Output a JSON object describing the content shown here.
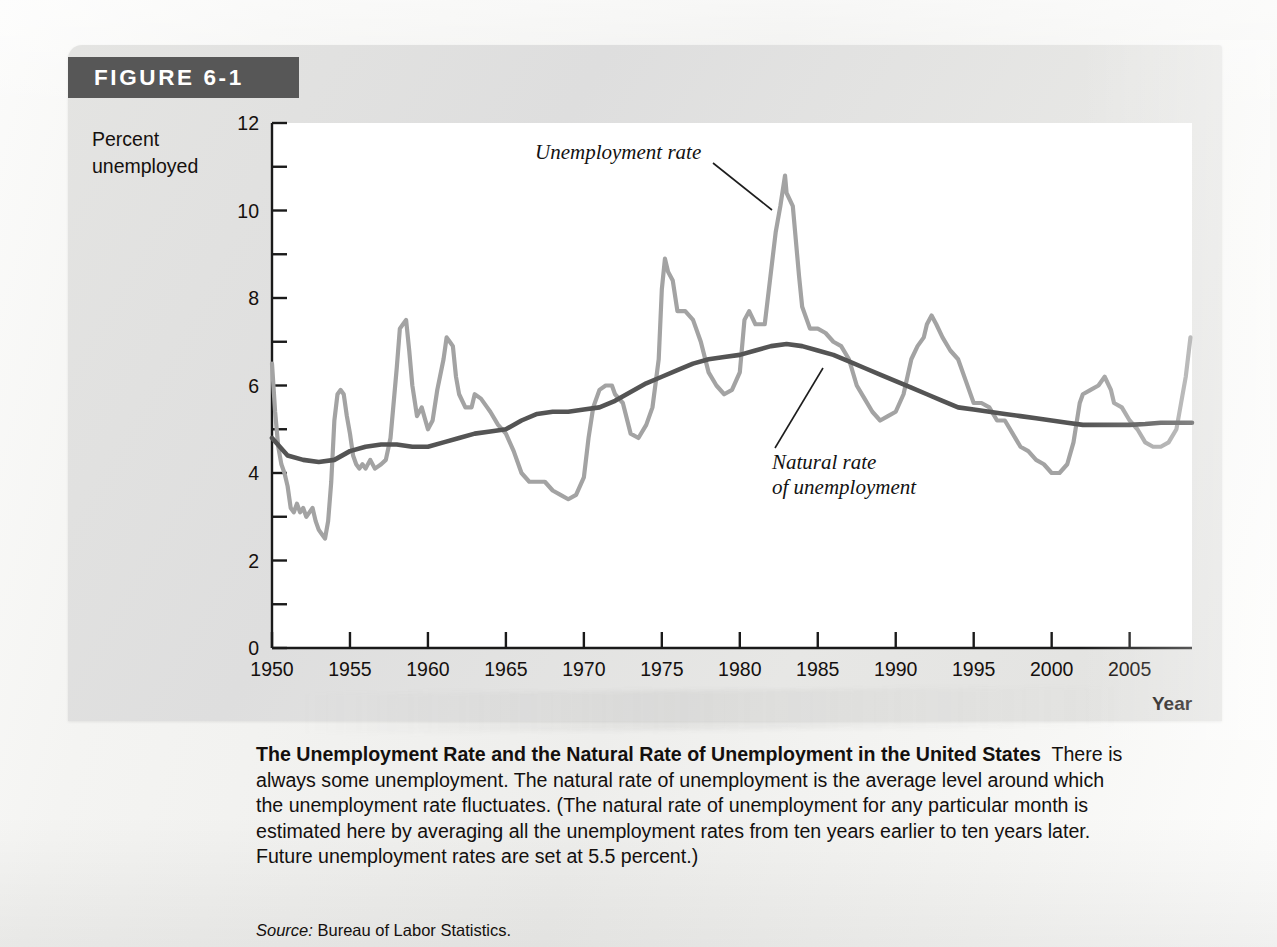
{
  "figure": {
    "tag_label": "FIGURE 6-1",
    "y_axis_title": "Percent\nunemployed",
    "x_axis_title": "Year",
    "annotations": {
      "series1": "Unemployment rate",
      "series2_line1": "Natural rate",
      "series2_line2": "of unemployment"
    }
  },
  "caption": {
    "title": "The Unemployment Rate and the Natural Rate of Unemployment in the United States",
    "body": "There is always some unemployment. The natural rate of unemployment is the average level around which the unemployment rate fluctuates. (The natural rate of unemployment for any particular month is estimated here by averaging all the unemployment rates from ten years earlier to ten years later. Future unemployment rates are set at 5.5 percent.)",
    "source_label": "Source:",
    "source_text": "Bureau of Labor Statistics."
  },
  "colors": {
    "unemployment_rate_line": "#a3a3a3",
    "natural_rate_line": "#545454",
    "axis": "#1a1a1a",
    "panel_bg": "#e3e3e1",
    "plot_bg": "#ffffff",
    "tag_bg": "#575757",
    "tag_text": "#ffffff"
  },
  "chart_data": {
    "type": "line",
    "title": "The Unemployment Rate and the Natural Rate of Unemployment in the United States",
    "xlabel": "Year",
    "ylabel": "Percent unemployed",
    "xlim": [
      1950,
      2009
    ],
    "ylim": [
      0,
      12
    ],
    "grid": false,
    "legend": "annotations-on-plot",
    "xticks": [
      1950,
      1955,
      1960,
      1965,
      1970,
      1975,
      1980,
      1985,
      1990,
      1995,
      2000,
      2005
    ],
    "xtick_labels": [
      "1950",
      "1955",
      "1960",
      "1965",
      "1970",
      "1975",
      "1980",
      "1985",
      "1990",
      "1995",
      "2000",
      "2005"
    ],
    "yticks": [
      0,
      2,
      4,
      6,
      8,
      10,
      12
    ],
    "ytick_labels": [
      "0",
      "2",
      "4",
      "6",
      "8",
      "10",
      "12"
    ],
    "yticks_minor": [
      1,
      3,
      5,
      7,
      9,
      11
    ],
    "series": [
      {
        "name": "Unemployment rate",
        "color": "#a3a3a3",
        "x": [
          1950.0,
          1950.2,
          1950.4,
          1950.6,
          1950.8,
          1951.0,
          1951.2,
          1951.4,
          1951.6,
          1951.8,
          1952.0,
          1952.2,
          1952.4,
          1952.6,
          1952.8,
          1953.0,
          1953.2,
          1953.4,
          1953.6,
          1953.8,
          1954.0,
          1954.2,
          1954.4,
          1954.6,
          1954.8,
          1955.0,
          1955.2,
          1955.4,
          1955.6,
          1955.8,
          1956.0,
          1956.3,
          1956.6,
          1957.0,
          1957.3,
          1957.6,
          1958.0,
          1958.2,
          1958.4,
          1958.6,
          1958.8,
          1959.0,
          1959.3,
          1959.6,
          1960.0,
          1960.3,
          1960.6,
          1961.0,
          1961.2,
          1961.4,
          1961.6,
          1961.8,
          1962.0,
          1962.4,
          1962.8,
          1963.0,
          1963.4,
          1963.8,
          1964.0,
          1964.5,
          1965.0,
          1965.5,
          1966.0,
          1966.5,
          1967.0,
          1967.5,
          1968.0,
          1968.5,
          1969.0,
          1969.5,
          1970.0,
          1970.3,
          1970.6,
          1971.0,
          1971.4,
          1971.8,
          1972.0,
          1972.5,
          1973.0,
          1973.5,
          1974.0,
          1974.4,
          1974.8,
          1975.0,
          1975.2,
          1975.4,
          1975.7,
          1976.0,
          1976.5,
          1977.0,
          1977.5,
          1978.0,
          1978.5,
          1979.0,
          1979.5,
          1980.0,
          1980.3,
          1980.6,
          1981.0,
          1981.3,
          1981.6,
          1982.0,
          1982.3,
          1982.6,
          1982.9,
          1983.0,
          1983.4,
          1983.8,
          1984.0,
          1984.5,
          1985.0,
          1985.5,
          1986.0,
          1986.5,
          1987.0,
          1987.5,
          1988.0,
          1988.5,
          1989.0,
          1989.5,
          1990.0,
          1990.5,
          1991.0,
          1991.4,
          1991.8,
          1992.0,
          1992.3,
          1992.6,
          1993.0,
          1993.5,
          1994.0,
          1994.5,
          1995.0,
          1995.5,
          1996.0,
          1996.5,
          1997.0,
          1997.5,
          1998.0,
          1998.5,
          1999.0,
          1999.5,
          2000.0,
          2000.5,
          2001.0,
          2001.4,
          2001.8,
          2002.0,
          2002.5,
          2003.0,
          2003.4,
          2003.8,
          2004.0,
          2004.5,
          2005.0,
          2005.5,
          2006.0,
          2006.5,
          2007.0,
          2007.5,
          2008.0,
          2008.3,
          2008.6,
          2008.9
        ],
        "y": [
          6.5,
          5.4,
          4.6,
          4.2,
          4.0,
          3.7,
          3.2,
          3.1,
          3.3,
          3.1,
          3.2,
          3.0,
          3.1,
          3.2,
          2.9,
          2.7,
          2.6,
          2.5,
          2.9,
          3.8,
          5.2,
          5.8,
          5.9,
          5.8,
          5.3,
          4.9,
          4.4,
          4.2,
          4.1,
          4.2,
          4.1,
          4.3,
          4.1,
          4.2,
          4.3,
          4.8,
          6.4,
          7.3,
          7.4,
          7.5,
          6.8,
          6.0,
          5.3,
          5.5,
          5.0,
          5.2,
          5.9,
          6.6,
          7.1,
          7.0,
          6.9,
          6.2,
          5.8,
          5.5,
          5.5,
          5.8,
          5.7,
          5.5,
          5.4,
          5.1,
          4.9,
          4.5,
          4.0,
          3.8,
          3.8,
          3.8,
          3.6,
          3.5,
          3.4,
          3.5,
          3.9,
          4.8,
          5.5,
          5.9,
          6.0,
          6.0,
          5.8,
          5.6,
          4.9,
          4.8,
          5.1,
          5.5,
          6.6,
          8.2,
          8.9,
          8.6,
          8.4,
          7.7,
          7.7,
          7.5,
          7.0,
          6.3,
          6.0,
          5.8,
          5.9,
          6.3,
          7.5,
          7.7,
          7.4,
          7.4,
          7.4,
          8.6,
          9.5,
          10.1,
          10.8,
          10.4,
          10.1,
          8.5,
          7.8,
          7.3,
          7.3,
          7.2,
          7.0,
          6.9,
          6.6,
          6.0,
          5.7,
          5.4,
          5.2,
          5.3,
          5.4,
          5.8,
          6.6,
          6.9,
          7.1,
          7.4,
          7.6,
          7.4,
          7.1,
          6.8,
          6.6,
          6.1,
          5.6,
          5.6,
          5.5,
          5.2,
          5.2,
          4.9,
          4.6,
          4.5,
          4.3,
          4.2,
          4.0,
          4.0,
          4.2,
          4.7,
          5.6,
          5.8,
          5.9,
          6.0,
          6.2,
          5.9,
          5.6,
          5.5,
          5.2,
          5.0,
          4.7,
          4.6,
          4.6,
          4.7,
          5.0,
          5.6,
          6.2,
          7.1
        ]
      },
      {
        "name": "Natural rate of unemployment",
        "color": "#545454",
        "x": [
          1950,
          1951,
          1952,
          1953,
          1954,
          1955,
          1956,
          1957,
          1958,
          1959,
          1960,
          1961,
          1962,
          1963,
          1964,
          1965,
          1966,
          1967,
          1968,
          1969,
          1970,
          1971,
          1972,
          1973,
          1974,
          1975,
          1976,
          1977,
          1978,
          1979,
          1980,
          1981,
          1982,
          1983,
          1984,
          1985,
          1986,
          1987,
          1988,
          1989,
          1990,
          1991,
          1992,
          1993,
          1994,
          1995,
          1996,
          1997,
          1998,
          1999,
          2000,
          2001,
          2002,
          2003,
          2004,
          2005,
          2006,
          2007,
          2008,
          2009
        ],
        "y": [
          4.8,
          4.4,
          4.3,
          4.25,
          4.3,
          4.5,
          4.6,
          4.65,
          4.65,
          4.6,
          4.6,
          4.7,
          4.8,
          4.9,
          4.95,
          5.0,
          5.2,
          5.35,
          5.4,
          5.4,
          5.45,
          5.5,
          5.65,
          5.85,
          6.05,
          6.2,
          6.35,
          6.5,
          6.6,
          6.65,
          6.7,
          6.8,
          6.9,
          6.95,
          6.9,
          6.8,
          6.7,
          6.55,
          6.4,
          6.25,
          6.1,
          5.95,
          5.8,
          5.65,
          5.5,
          5.45,
          5.4,
          5.35,
          5.3,
          5.25,
          5.2,
          5.15,
          5.1,
          5.1,
          5.1,
          5.1,
          5.12,
          5.15,
          5.15,
          5.15
        ]
      }
    ]
  }
}
